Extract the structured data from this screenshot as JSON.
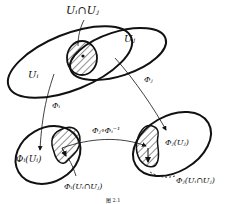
{
  "diagram": {
    "labels": {
      "intersection": "U_i∩U_j",
      "set_ui": "U_i",
      "set_uj": "U_j",
      "map_phi_i": "Φ_i",
      "map_phi_j": "Φ_j",
      "image_phi_i_ui": "Φ_i(U_i)",
      "image_phi_j_uj": "Φ_j(U_j)",
      "transition": "Φ_j∘Φ_i⁻¹",
      "image_phi_i_inter": "Φ_i(U_i∩U_j)",
      "image_phi_j_inter": "Φ_j(U_i∩U_j)",
      "caption": "图 2.1"
    },
    "text": {
      "intersection": "Uᵢ∩Uⱼ",
      "set_uj": "Uⱼ",
      "set_ui": "Uᵢ",
      "phi_j": "Φⱼ",
      "phi_i": "Φᵢ",
      "transition": "Φⱼ∘Φᵢ⁻¹",
      "phi_i_ui": "Φᵢ(Uᵢ)",
      "phi_j_uj": "Φⱼ(Uⱼ)",
      "phi_i_inter": "Φᵢ(Uᵢ∩Uⱼ)",
      "phi_j_inter": "Φⱼ(Uᵢ∩Uⱼ)",
      "caption": "图  2.1"
    },
    "colors": {
      "stroke": "#111111",
      "background": "#ffffff"
    }
  }
}
